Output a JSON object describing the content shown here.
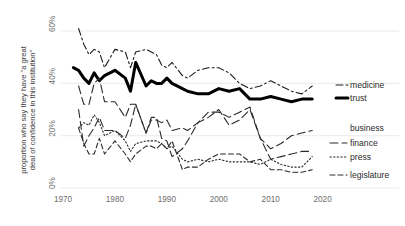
{
  "chart_data": {
    "type": "line",
    "title": "",
    "xlabel": "",
    "ylabel": "proportion who say they have \"a great deal of confidence in this institution\"",
    "ylabel_line1": "proportion who say they have \"a great",
    "ylabel_line2": "deal of confidence in this institution\"",
    "xlim": [
      1970,
      2022
    ],
    "ylim": [
      0,
      65
    ],
    "grid": true,
    "legend_position": "right-inline",
    "xticks": [
      1970,
      1980,
      1990,
      2000,
      2010,
      2020
    ],
    "xtick_labels": [
      "1970",
      "1980",
      "1990",
      "2000",
      "2010",
      "2020"
    ],
    "yticks": [
      0,
      20,
      40,
      60
    ],
    "ytick_labels": [
      "0%",
      "20%",
      "40%",
      "60%"
    ],
    "series": [
      {
        "name": "medicine",
        "label": "medicine",
        "style": "dash-dot",
        "color": "#1a1a1a",
        "width": 1.1,
        "x": [
          1973,
          1974,
          1975,
          1976,
          1977,
          1978,
          1980,
          1982,
          1983,
          1984,
          1986,
          1987,
          1988,
          1989,
          1990,
          1991,
          1993,
          1994,
          1996,
          1998,
          2000,
          2002,
          2004,
          2006,
          2008,
          2010,
          2012,
          2014,
          2016,
          2018
        ],
        "values": [
          61,
          55,
          51,
          53,
          52,
          46,
          53,
          52,
          46,
          52,
          53,
          52,
          51,
          47,
          46,
          48,
          43,
          42,
          45,
          46,
          46,
          44,
          40,
          38,
          39,
          41,
          39,
          37,
          36,
          39
        ]
      },
      {
        "name": "trust",
        "label": "trust",
        "style": "solid",
        "color": "#000000",
        "width": 3.0,
        "x": [
          1972,
          1973,
          1974,
          1975,
          1976,
          1977,
          1978,
          1980,
          1982,
          1983,
          1984,
          1986,
          1987,
          1988,
          1989,
          1990,
          1991,
          1993,
          1994,
          1996,
          1998,
          2000,
          2002,
          2004,
          2006,
          2008,
          2010,
          2012,
          2014,
          2016,
          2018
        ],
        "values": [
          46,
          45,
          42,
          40,
          44,
          41,
          43,
          45,
          42,
          37,
          48,
          39,
          41,
          40,
          40,
          42,
          40,
          38,
          37,
          36,
          36,
          38,
          37,
          38,
          34,
          34,
          35,
          34,
          33,
          34,
          34
        ]
      },
      {
        "name": "business",
        "label": "business",
        "style": "long-dash",
        "color": "#2b2b2b",
        "width": 1.1,
        "x": [
          1973,
          1974,
          1975,
          1976,
          1977,
          1978,
          1980,
          1982,
          1983,
          1984,
          1986,
          1987,
          1988,
          1989,
          1990,
          1991,
          1993,
          1994,
          1996,
          1998,
          2000,
          2002,
          2004,
          2006,
          2008,
          2010,
          2012,
          2014,
          2016,
          2018
        ],
        "values": [
          30,
          16,
          20,
          23,
          27,
          22,
          22,
          19,
          24,
          32,
          21,
          26,
          26,
          25,
          26,
          22,
          23,
          22,
          25,
          29,
          29,
          27,
          29,
          31,
          19,
          15,
          17,
          20,
          21,
          22
        ]
      },
      {
        "name": "finance",
        "label": "finance",
        "style": "long-dash",
        "color": "#2b2b2b",
        "width": 1.1,
        "x": [
          1973,
          1974,
          1975,
          1976,
          1977,
          1978,
          1980,
          1982,
          1983,
          1984,
          1986,
          1987,
          1988,
          1989,
          1990,
          1991,
          1993,
          1994,
          1996,
          1998,
          2000,
          2002,
          2004,
          2006,
          2008,
          2010,
          2012,
          2014,
          2016,
          2018
        ],
        "values": [
          39,
          32,
          32,
          40,
          42,
          33,
          33,
          27,
          32,
          32,
          21,
          27,
          27,
          19,
          18,
          12,
          15,
          18,
          25,
          27,
          30,
          24,
          26,
          30,
          19,
          11,
          12,
          13,
          14,
          14
        ]
      },
      {
        "name": "press",
        "label": "press",
        "style": "dotted",
        "color": "#2b2b2b",
        "width": 1.1,
        "x": [
          1973,
          1974,
          1975,
          1976,
          1977,
          1978,
          1980,
          1982,
          1983,
          1984,
          1986,
          1987,
          1988,
          1989,
          1990,
          1991,
          1993,
          1994,
          1996,
          1998,
          2000,
          2002,
          2004,
          2006,
          2008,
          2010,
          2012,
          2014,
          2016,
          2018
        ],
        "values": [
          23,
          25,
          24,
          28,
          25,
          20,
          22,
          18,
          14,
          17,
          18,
          18,
          18,
          17,
          15,
          16,
          11,
          10,
          11,
          10,
          11,
          10,
          10,
          10,
          9,
          11,
          9,
          8,
          8,
          12
        ]
      },
      {
        "name": "legislature",
        "label": "legislature",
        "style": "dash",
        "color": "#2b2b2b",
        "width": 1.1,
        "x": [
          1973,
          1974,
          1975,
          1976,
          1977,
          1978,
          1980,
          1982,
          1983,
          1984,
          1986,
          1987,
          1988,
          1989,
          1990,
          1991,
          1993,
          1994,
          1996,
          1998,
          2000,
          2002,
          2004,
          2006,
          2008,
          2010,
          2012,
          2014,
          2016,
          2018
        ],
        "values": [
          23,
          17,
          13,
          13,
          19,
          13,
          18,
          13,
          10,
          13,
          16,
          16,
          15,
          17,
          15,
          18,
          7,
          8,
          8,
          11,
          13,
          13,
          13,
          10,
          11,
          7,
          7,
          6,
          6,
          7
        ]
      }
    ]
  },
  "labels": {
    "medicine": "medicine",
    "trust": "trust",
    "business": "business",
    "finance": "finance",
    "press": "press",
    "legislature": "legislature"
  },
  "top_fragment": ""
}
